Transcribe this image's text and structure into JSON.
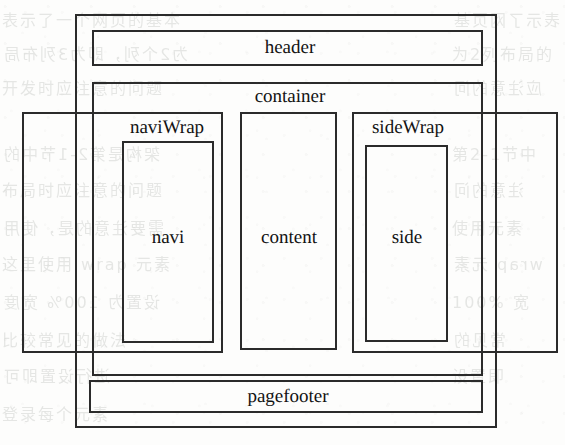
{
  "diagram": {
    "kind": "nested-box-layout-diagram",
    "ink_color": "#2b2b2b",
    "text_color": "#121212",
    "paper_color": "#fdfdfc",
    "boxes": [
      {
        "id": "page",
        "label": "",
        "x": 75,
        "y": 14,
        "w": 422,
        "h": 414
      },
      {
        "id": "header",
        "label": "header",
        "x": 92,
        "y": 30,
        "w": 391,
        "h": 36
      },
      {
        "id": "container",
        "label": "container",
        "x": 92,
        "y": 82,
        "w": 391,
        "h": 294
      },
      {
        "id": "naviWrap",
        "label": "naviWrap",
        "x": 22,
        "y": 112,
        "w": 201,
        "h": 241
      },
      {
        "id": "navi",
        "label": "navi",
        "x": 122,
        "y": 141,
        "w": 92,
        "h": 202
      },
      {
        "id": "content",
        "label": "content",
        "x": 240,
        "y": 112,
        "w": 97,
        "h": 238
      },
      {
        "id": "sideWrap",
        "label": "sideWrap",
        "x": 352,
        "y": 112,
        "w": 206,
        "h": 241
      },
      {
        "id": "side",
        "label": "side",
        "x": 365,
        "y": 145,
        "w": 83,
        "h": 197
      },
      {
        "id": "pagefooter",
        "label": "pagefooter",
        "x": 89,
        "y": 380,
        "w": 394,
        "h": 33
      }
    ],
    "labels": [
      {
        "id": "header",
        "text": "header",
        "x": 245,
        "y": 38,
        "w": 90,
        "align": "center"
      },
      {
        "id": "container",
        "text": "container",
        "x": 240,
        "y": 87,
        "w": 100,
        "align": "center"
      },
      {
        "id": "naviWrap",
        "text": "naviWrap",
        "x": 118,
        "y": 118,
        "w": 98,
        "align": "center"
      },
      {
        "id": "navi",
        "text": "navi",
        "x": 137,
        "y": 228,
        "w": 62,
        "align": "center"
      },
      {
        "id": "content",
        "text": "content",
        "x": 244,
        "y": 228,
        "w": 90,
        "align": "center"
      },
      {
        "id": "sideWrap",
        "text": "sideWrap",
        "x": 360,
        "y": 118,
        "w": 96,
        "align": "center"
      },
      {
        "id": "side",
        "text": "side",
        "x": 378,
        "y": 228,
        "w": 58,
        "align": "center"
      },
      {
        "id": "pagefooter",
        "text": "pagefooter",
        "x": 228,
        "y": 387,
        "w": 120,
        "align": "center"
      }
    ],
    "bleed_through_text": {
      "note": "faint mirrored show-through text from the reverse of the scanned page",
      "lines": [
        {
          "text": "表示了一个网页的基本",
          "x": 2,
          "y": 6
        },
        {
          "text": "为2个列，即为3列布局",
          "x": 2,
          "y": 40
        },
        {
          "text": "开发时应注意的问题",
          "x": 2,
          "y": 74
        },
        {
          "text": "架构是第2-1节中的",
          "x": 2,
          "y": 140
        },
        {
          "text": "布局时应注意的问题",
          "x": 2,
          "y": 176
        },
        {
          "text": "需要注意的是，使用",
          "x": 2,
          "y": 214
        },
        {
          "text": "这里使用 wrap 元素",
          "x": 2,
          "y": 250
        },
        {
          "text": "设置为 100% 宽度",
          "x": 2,
          "y": 288
        },
        {
          "text": "比较常见的做法",
          "x": 2,
          "y": 326
        },
        {
          "text": "进行设置即可",
          "x": 2,
          "y": 362
        },
        {
          "text": "登录每个元素",
          "x": 2,
          "y": 400
        },
        {
          "text": "表示了网页基",
          "x": 452,
          "y": 6
        },
        {
          "text": "为2列布局的",
          "x": 452,
          "y": 40
        },
        {
          "text": "应注意的问",
          "x": 452,
          "y": 74
        },
        {
          "text": "第2-1节中",
          "x": 452,
          "y": 140
        },
        {
          "text": "注意的问",
          "x": 452,
          "y": 176
        },
        {
          "text": "使用元素",
          "x": 452,
          "y": 214
        },
        {
          "text": "wrap 元素",
          "x": 452,
          "y": 250
        },
        {
          "text": "100% 宽",
          "x": 452,
          "y": 288
        },
        {
          "text": "常见的",
          "x": 452,
          "y": 326
        },
        {
          "text": "设置即",
          "x": 452,
          "y": 362
        }
      ]
    }
  }
}
